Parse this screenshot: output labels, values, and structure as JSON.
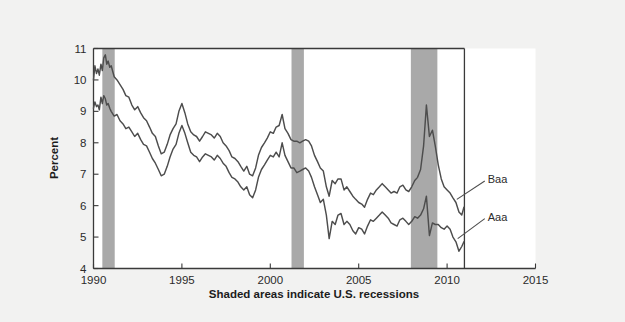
{
  "chart_data": {
    "type": "line",
    "title": "",
    "subtitle": "",
    "caption": "Shaded areas indicate U.S. recessions",
    "xlabel": "",
    "ylabel": "Percent",
    "xlim": [
      1990,
      2015
    ],
    "ylim": [
      4,
      11
    ],
    "grid": false,
    "legend_position": "inline-right",
    "x_ticks": [
      1990,
      1995,
      2000,
      2005,
      2010,
      2015
    ],
    "x_tick_labels": [
      "1990",
      "1995",
      "2000",
      "2005",
      "2010",
      "2015"
    ],
    "y_ticks": [
      4,
      5,
      6,
      7,
      8,
      9,
      10,
      11
    ],
    "y_tick_labels": [
      "4",
      "5",
      "6",
      "7",
      "8",
      "9",
      "10",
      "11"
    ],
    "colors": {
      "line": "#4d4d4d",
      "recession_band": "#a9a9a9",
      "plot_background": "#ffffff",
      "figure_background": "#f2f2f1",
      "axis": "#3a3a3a"
    },
    "shaded_regions": [
      {
        "name": "recession-1990-1991",
        "x0": 1990.5,
        "x1": 1991.2
      },
      {
        "name": "recession-2001",
        "x0": 2001.2,
        "x1": 2001.9
      },
      {
        "name": "recession-2007-2009",
        "x0": 2007.95,
        "x1": 2009.45
      }
    ],
    "annotations": [
      {
        "name": "baa-label",
        "text": "Baa",
        "x": 2012.3,
        "y": 6.85
      },
      {
        "name": "aaa-label",
        "text": "Aaa",
        "x": 2012.3,
        "y": 5.65
      }
    ],
    "series": [
      {
        "name": "Baa",
        "label": "Baa",
        "x": [
          1990.0,
          1990.08,
          1990.17,
          1990.25,
          1990.33,
          1990.42,
          1990.5,
          1990.58,
          1990.67,
          1990.75,
          1990.83,
          1990.92,
          1991.0,
          1991.17,
          1991.33,
          1991.5,
          1991.67,
          1991.83,
          1992.0,
          1992.17,
          1992.33,
          1992.5,
          1992.67,
          1992.83,
          1993.0,
          1993.17,
          1993.33,
          1993.5,
          1993.67,
          1993.83,
          1994.0,
          1994.17,
          1994.33,
          1994.5,
          1994.67,
          1994.83,
          1995.0,
          1995.17,
          1995.33,
          1995.5,
          1995.67,
          1995.83,
          1996.0,
          1996.17,
          1996.33,
          1996.5,
          1996.67,
          1996.83,
          1997.0,
          1997.17,
          1997.33,
          1997.5,
          1997.67,
          1997.83,
          1998.0,
          1998.17,
          1998.33,
          1998.5,
          1998.67,
          1998.83,
          1999.0,
          1999.17,
          1999.33,
          1999.5,
          1999.67,
          1999.83,
          2000.0,
          2000.17,
          2000.33,
          2000.5,
          2000.67,
          2000.83,
          2001.0,
          2001.17,
          2001.33,
          2001.5,
          2001.67,
          2001.83,
          2002.0,
          2002.17,
          2002.33,
          2002.5,
          2002.67,
          2002.83,
          2003.0,
          2003.17,
          2003.33,
          2003.5,
          2003.67,
          2003.83,
          2004.0,
          2004.17,
          2004.33,
          2004.5,
          2004.67,
          2004.83,
          2005.0,
          2005.17,
          2005.33,
          2005.5,
          2005.67,
          2005.83,
          2006.0,
          2006.17,
          2006.33,
          2006.5,
          2006.67,
          2006.83,
          2007.0,
          2007.17,
          2007.33,
          2007.5,
          2007.67,
          2007.83,
          2008.0,
          2008.17,
          2008.33,
          2008.5,
          2008.67,
          2008.83,
          2009.0,
          2009.17,
          2009.33,
          2009.5,
          2009.67,
          2009.83,
          2010.0,
          2010.17,
          2010.33,
          2010.5,
          2010.67,
          2010.83,
          2010.95
        ],
        "y": [
          10.0,
          10.45,
          10.2,
          10.35,
          10.15,
          10.5,
          10.3,
          10.7,
          10.8,
          10.5,
          10.6,
          10.4,
          10.45,
          10.1,
          10.0,
          9.85,
          9.7,
          9.5,
          9.45,
          9.2,
          9.05,
          9.15,
          8.95,
          8.8,
          8.7,
          8.5,
          8.3,
          8.2,
          7.9,
          7.65,
          7.7,
          7.95,
          8.25,
          8.45,
          8.6,
          9.0,
          9.25,
          8.95,
          8.6,
          8.35,
          8.25,
          8.2,
          8.05,
          8.2,
          8.35,
          8.3,
          8.25,
          8.15,
          8.3,
          8.2,
          8.0,
          7.9,
          7.75,
          7.55,
          7.5,
          7.4,
          7.25,
          7.1,
          7.25,
          7.0,
          6.95,
          7.2,
          7.6,
          7.85,
          8.0,
          8.15,
          8.35,
          8.3,
          8.5,
          8.55,
          8.9,
          8.45,
          8.3,
          8.1,
          8.05,
          8.05,
          8.0,
          8.05,
          8.1,
          8.05,
          7.9,
          7.6,
          7.4,
          7.2,
          7.1,
          6.6,
          6.3,
          6.8,
          6.7,
          6.85,
          6.85,
          6.5,
          6.6,
          6.45,
          6.3,
          6.2,
          6.1,
          6.05,
          5.95,
          6.2,
          6.4,
          6.35,
          6.5,
          6.6,
          6.7,
          6.6,
          6.5,
          6.4,
          6.45,
          6.4,
          6.6,
          6.65,
          6.5,
          6.45,
          6.6,
          6.8,
          6.9,
          7.15,
          7.9,
          9.2,
          8.2,
          8.4,
          7.9,
          7.3,
          6.85,
          6.6,
          6.5,
          6.4,
          6.25,
          6.1,
          5.8,
          5.7,
          5.95
        ]
      },
      {
        "name": "Aaa",
        "label": "Aaa",
        "x": [
          1990.0,
          1990.08,
          1990.17,
          1990.25,
          1990.33,
          1990.42,
          1990.5,
          1990.58,
          1990.67,
          1990.75,
          1990.83,
          1990.92,
          1991.0,
          1991.17,
          1991.33,
          1991.5,
          1991.67,
          1991.83,
          1992.0,
          1992.17,
          1992.33,
          1992.5,
          1992.67,
          1992.83,
          1993.0,
          1993.17,
          1993.33,
          1993.5,
          1993.67,
          1993.83,
          1994.0,
          1994.17,
          1994.33,
          1994.5,
          1994.67,
          1994.83,
          1995.0,
          1995.17,
          1995.33,
          1995.5,
          1995.67,
          1995.83,
          1996.0,
          1996.17,
          1996.33,
          1996.5,
          1996.67,
          1996.83,
          1997.0,
          1997.17,
          1997.33,
          1997.5,
          1997.67,
          1997.83,
          1998.0,
          1998.17,
          1998.33,
          1998.5,
          1998.67,
          1998.83,
          1999.0,
          1999.17,
          1999.33,
          1999.5,
          1999.67,
          1999.83,
          2000.0,
          2000.17,
          2000.33,
          2000.5,
          2000.67,
          2000.83,
          2001.0,
          2001.17,
          2001.33,
          2001.5,
          2001.67,
          2001.83,
          2002.0,
          2002.17,
          2002.33,
          2002.5,
          2002.67,
          2002.83,
          2003.0,
          2003.17,
          2003.33,
          2003.5,
          2003.67,
          2003.83,
          2004.0,
          2004.17,
          2004.33,
          2004.5,
          2004.67,
          2004.83,
          2005.0,
          2005.17,
          2005.33,
          2005.5,
          2005.67,
          2005.83,
          2006.0,
          2006.17,
          2006.33,
          2006.5,
          2006.67,
          2006.83,
          2007.0,
          2007.17,
          2007.33,
          2007.5,
          2007.67,
          2007.83,
          2008.0,
          2008.17,
          2008.33,
          2008.5,
          2008.67,
          2008.83,
          2009.0,
          2009.17,
          2009.33,
          2009.5,
          2009.67,
          2009.83,
          2010.0,
          2010.17,
          2010.33,
          2010.5,
          2010.67,
          2010.83,
          2010.95
        ],
        "y": [
          9.1,
          9.3,
          9.15,
          9.2,
          9.05,
          9.45,
          9.25,
          9.5,
          9.4,
          9.2,
          9.25,
          9.1,
          9.0,
          8.85,
          8.9,
          8.7,
          8.6,
          8.45,
          8.5,
          8.35,
          8.2,
          8.3,
          8.1,
          7.95,
          7.9,
          7.7,
          7.5,
          7.35,
          7.15,
          6.95,
          7.0,
          7.25,
          7.55,
          7.8,
          7.95,
          8.3,
          8.55,
          8.3,
          8.0,
          7.7,
          7.6,
          7.55,
          7.4,
          7.55,
          7.65,
          7.6,
          7.55,
          7.45,
          7.6,
          7.5,
          7.35,
          7.25,
          7.05,
          6.9,
          6.85,
          6.75,
          6.6,
          6.5,
          6.6,
          6.35,
          6.25,
          6.5,
          6.9,
          7.15,
          7.3,
          7.45,
          7.6,
          7.55,
          7.7,
          7.55,
          8.0,
          7.6,
          7.4,
          7.2,
          7.2,
          7.05,
          7.1,
          7.15,
          7.2,
          7.1,
          6.9,
          6.6,
          6.35,
          6.1,
          6.2,
          5.7,
          4.95,
          5.5,
          5.4,
          5.7,
          5.75,
          5.4,
          5.5,
          5.4,
          5.2,
          5.1,
          5.3,
          5.25,
          5.1,
          5.35,
          5.55,
          5.5,
          5.6,
          5.7,
          5.8,
          5.7,
          5.6,
          5.45,
          5.4,
          5.35,
          5.55,
          5.6,
          5.5,
          5.4,
          5.5,
          5.65,
          5.6,
          5.7,
          5.9,
          6.3,
          5.05,
          5.45,
          5.4,
          5.4,
          5.3,
          5.25,
          5.35,
          5.25,
          5.0,
          4.85,
          4.55,
          4.7,
          4.85
        ]
      }
    ]
  },
  "annotation_labels": {
    "baa": "Baa",
    "aaa": "Aaa"
  },
  "ylabel_text": "Percent",
  "caption_text": "Shaded areas indicate U.S. recessions"
}
